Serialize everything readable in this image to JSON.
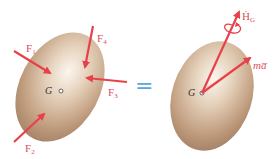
{
  "diagram": {
    "left_body": {
      "center_label": "G",
      "forces": [
        {
          "name": "F",
          "sub": "1"
        },
        {
          "name": "F",
          "sub": "2"
        },
        {
          "name": "F",
          "sub": "3"
        },
        {
          "name": "F",
          "sub": "4"
        }
      ]
    },
    "equals": "=",
    "right_body": {
      "center_label": "G",
      "vectors": [
        {
          "name": "Ḣ",
          "sub": "G"
        },
        {
          "name": "ma̅",
          "sub": ""
        }
      ]
    },
    "colors": {
      "arrow": "#e8414a",
      "label": "#d8505a",
      "equals": "#5aa8d8",
      "body": "#c9a789"
    }
  }
}
